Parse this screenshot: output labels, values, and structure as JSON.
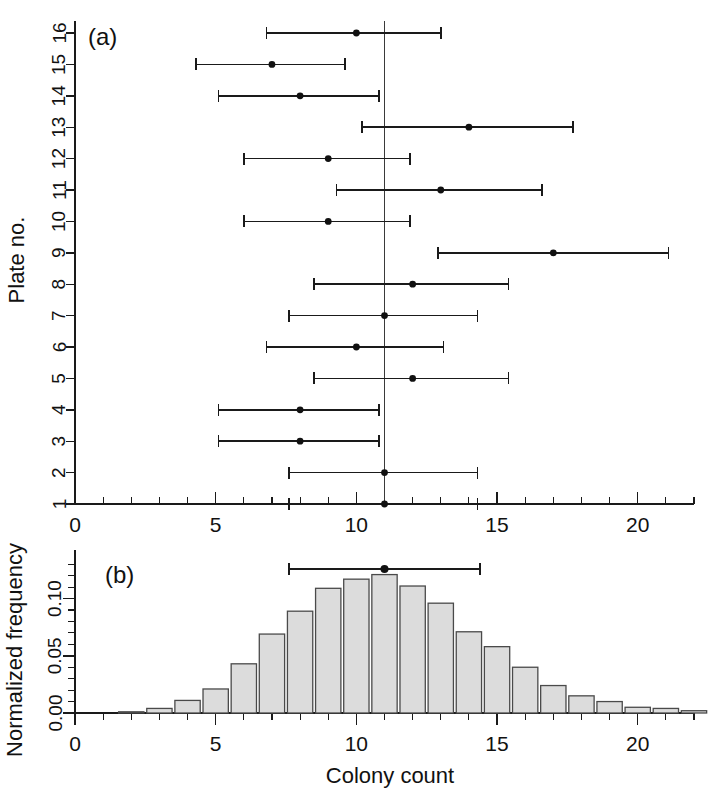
{
  "figure": {
    "width": 710,
    "height": 789,
    "background": "#ffffff",
    "ink_color": "#1a1a1a",
    "bar_fill": "#dcdcdc",
    "bar_stroke": "#4a4a4a"
  },
  "panel_a": {
    "label": "(a)",
    "ylabel": "Plate no.",
    "xlabel": "",
    "xlim": [
      0,
      22
    ],
    "xticks_major": [
      0,
      5,
      10,
      15,
      20
    ],
    "xticklabels": [
      "0",
      "5",
      "10",
      "15",
      "20"
    ],
    "xtick_minor_step": 1,
    "yticks": [
      1,
      2,
      3,
      4,
      5,
      6,
      7,
      8,
      9,
      10,
      11,
      12,
      13,
      14,
      15,
      16
    ],
    "yticklabels": [
      "1",
      "2",
      "3",
      "4",
      "5",
      "6",
      "7",
      "8",
      "9",
      "10",
      "11",
      "12",
      "13",
      "14",
      "15",
      "16"
    ],
    "reference_line_x": 11
  },
  "panel_b": {
    "label": "(b)",
    "ylabel": "Normalized frequency",
    "xlabel": "Colony count",
    "xlim": [
      0,
      22
    ],
    "ylim": [
      0,
      0.132
    ],
    "xticks_major": [
      0,
      5,
      10,
      15,
      20
    ],
    "xticklabels": [
      "0",
      "5",
      "10",
      "15",
      "20"
    ],
    "yticks_major": [
      0.0,
      0.05,
      0.1
    ],
    "yticklabels": [
      "0.00",
      "0.05",
      "0.10"
    ],
    "xtick_minor_step": 1,
    "ytick_minor_step": 0.01
  },
  "chart_data": [
    {
      "type": "scatter",
      "name": "plate-confidence-intervals",
      "title": "(a)",
      "xlabel": "Colony count",
      "ylabel": "Plate no.",
      "xlim": [
        0,
        22
      ],
      "ylim": [
        0.5,
        16.5
      ],
      "grid": false,
      "legend": "none",
      "annotations": [
        {
          "text": "(a)",
          "x": 1.1,
          "y": 16.0
        },
        {
          "text": "vertical reference line at colony count = 11",
          "x": 11,
          "y": 0
        }
      ],
      "reference_line_x": 11,
      "points": [
        {
          "plate": 16,
          "estimate": 10.0,
          "low": 6.8,
          "high": 13.0
        },
        {
          "plate": 15,
          "estimate": 7.0,
          "low": 4.3,
          "high": 9.6
        },
        {
          "plate": 14,
          "estimate": 8.0,
          "low": 5.1,
          "high": 10.8
        },
        {
          "plate": 13,
          "estimate": 14.0,
          "low": 10.2,
          "high": 17.7
        },
        {
          "plate": 12,
          "estimate": 9.0,
          "low": 6.0,
          "high": 11.9
        },
        {
          "plate": 11,
          "estimate": 13.0,
          "low": 9.3,
          "high": 16.6
        },
        {
          "plate": 10,
          "estimate": 9.0,
          "low": 6.0,
          "high": 11.9
        },
        {
          "plate": 9,
          "estimate": 17.0,
          "low": 12.9,
          "high": 21.1
        },
        {
          "plate": 8,
          "estimate": 12.0,
          "low": 8.5,
          "high": 15.4
        },
        {
          "plate": 7,
          "estimate": 11.0,
          "low": 7.6,
          "high": 14.3
        },
        {
          "plate": 6,
          "estimate": 10.0,
          "low": 6.8,
          "high": 13.1
        },
        {
          "plate": 5,
          "estimate": 12.0,
          "low": 8.5,
          "high": 15.4
        },
        {
          "plate": 4,
          "estimate": 8.0,
          "low": 5.1,
          "high": 10.8
        },
        {
          "plate": 3,
          "estimate": 8.0,
          "low": 5.1,
          "high": 10.8
        },
        {
          "plate": 2,
          "estimate": 11.0,
          "low": 7.6,
          "high": 14.3
        },
        {
          "plate": 1,
          "estimate": 11.0,
          "low": 7.6,
          "high": 14.3
        }
      ]
    },
    {
      "type": "bar",
      "name": "colony-count-histogram",
      "title": "(b)",
      "xlabel": "Colony count",
      "ylabel": "Normalized frequency",
      "xlim": [
        0,
        22
      ],
      "ylim": [
        0,
        0.132
      ],
      "grid": false,
      "legend": "none",
      "bar_width": 0.9,
      "categories": [
        0,
        1,
        2,
        3,
        4,
        5,
        6,
        7,
        8,
        9,
        10,
        11,
        12,
        13,
        14,
        15,
        16,
        17,
        18,
        19,
        20,
        21,
        22
      ],
      "values": [
        0.0,
        0.0,
        0.001,
        0.004,
        0.011,
        0.021,
        0.043,
        0.069,
        0.089,
        0.109,
        0.117,
        0.121,
        0.111,
        0.096,
        0.071,
        0.058,
        0.04,
        0.024,
        0.015,
        0.01,
        0.005,
        0.004,
        0.002
      ],
      "overlay_interval": {
        "estimate": 11.0,
        "low": 7.6,
        "high": 14.4
      },
      "annotations": [
        {
          "text": "(b)",
          "x": 1.1,
          "y": 0.128
        }
      ]
    }
  ]
}
